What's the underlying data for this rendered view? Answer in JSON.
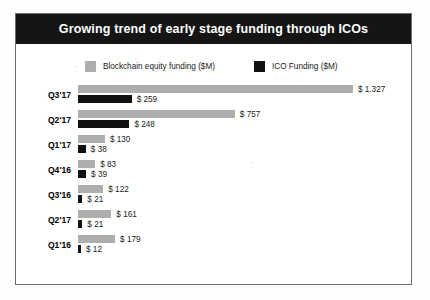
{
  "chart_data": {
    "type": "bar",
    "title": "Growing trend of early stage funding through ICOs",
    "xlabel": "",
    "ylabel": "",
    "orientation": "horizontal",
    "grid": false,
    "legend_position": "top",
    "axis_max": 1400,
    "categories": [
      "Q3'17",
      "Q2'17",
      "Q1'17",
      "Q4'16",
      "Q3'16",
      "Q2'17",
      "Q1'16"
    ],
    "series": [
      {
        "name": "Blockchain equity funding ($M)",
        "color": "#aeaeae",
        "values": [
          1327,
          757,
          130,
          83,
          122,
          161,
          179
        ],
        "labels": [
          "$ 1.327",
          "$ 757",
          "$ 130",
          "$ 83",
          "$ 122",
          "$ 161",
          "$ 179"
        ]
      },
      {
        "name": "ICO Funding ($M)",
        "color": "#111111",
        "values": [
          259,
          248,
          38,
          39,
          21,
          21,
          12
        ],
        "labels": [
          "$ 259",
          "$ 248",
          "$ 38",
          "$ 39",
          "$ 21",
          "$ 21",
          "$ 12"
        ]
      }
    ]
  },
  "title_bar": {
    "text": "Growing trend of early stage funding through ICOs",
    "background": "#151515",
    "text_color": "#ffffff"
  },
  "legend": {
    "items": [
      {
        "label": "Blockchain equity funding ($M)",
        "color": "#aeaeae",
        "swatch": "grey-swatch"
      },
      {
        "label": "ICO Funding ($M)",
        "color": "#111111",
        "swatch": "black-swatch"
      }
    ]
  },
  "rows": [
    {
      "category": "Q3'17",
      "equity_value": 1327,
      "equity_label": "$ 1.327",
      "ico_value": 259,
      "ico_label": "$ 259"
    },
    {
      "category": "Q2'17",
      "equity_value": 757,
      "equity_label": "$ 757",
      "ico_value": 248,
      "ico_label": "$ 248"
    },
    {
      "category": "Q1'17",
      "equity_value": 130,
      "equity_label": "$ 130",
      "ico_value": 38,
      "ico_label": "$ 38"
    },
    {
      "category": "Q4'16",
      "equity_value": 83,
      "equity_label": "$ 83",
      "ico_value": 39,
      "ico_label": "$ 39"
    },
    {
      "category": "Q3'16",
      "equity_value": 122,
      "equity_label": "$ 122",
      "ico_value": 21,
      "ico_label": "$ 21"
    },
    {
      "category": "Q2'17",
      "equity_value": 161,
      "equity_label": "$ 161",
      "ico_value": 21,
      "ico_label": "$ 21"
    },
    {
      "category": "Q1'16",
      "equity_value": 179,
      "equity_label": "$ 179",
      "ico_value": 12,
      "ico_label": "$ 12"
    }
  ],
  "scale": {
    "px_per_unit": 0.2072,
    "min_bar_px": 3
  }
}
